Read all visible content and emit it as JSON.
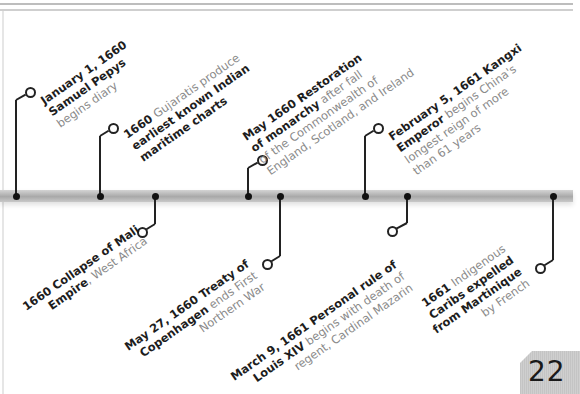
{
  "timeline": {
    "above": [
      {
        "date": "January 1, 1660",
        "lines": [
          [
            {
              "t": "January 1, 1660",
              "b": true
            }
          ],
          [
            {
              "t": "Samuel Pepys",
              "b": true
            }
          ],
          [
            {
              "t": "begins diary",
              "b": false
            }
          ]
        ]
      },
      {
        "date": "1660",
        "lines": [
          [
            {
              "t": "1660 ",
              "b": true
            },
            {
              "t": "Gujaratis produce",
              "b": false
            }
          ],
          [
            {
              "t": "earliest known Indian",
              "b": true
            }
          ],
          [
            {
              "t": "maritime charts",
              "b": true
            }
          ]
        ]
      },
      {
        "date": "May 1660",
        "lines": [
          [
            {
              "t": "May 1660 Restoration",
              "b": true
            }
          ],
          [
            {
              "t": "of monarchy",
              "b": true
            },
            {
              "t": " after fall",
              "b": false
            }
          ],
          [
            {
              "t": "of the Commonwealth of",
              "b": false
            }
          ],
          [
            {
              "t": "England, Scotland, and Ireland",
              "b": false
            }
          ]
        ]
      },
      {
        "date": "February 5, 1661",
        "lines": [
          [
            {
              "t": "February 5, 1661 Kangxi",
              "b": true
            }
          ],
          [
            {
              "t": "Emperor",
              "b": true
            },
            {
              "t": " begins China's",
              "b": false
            }
          ],
          [
            {
              "t": "longest reign of more",
              "b": false
            }
          ],
          [
            {
              "t": "than 61 years",
              "b": false
            }
          ]
        ]
      }
    ],
    "below": [
      {
        "date": "1660",
        "lines": [
          [
            {
              "t": "1660 Collapse of Mali",
              "b": true
            }
          ],
          [
            {
              "t": "Empire",
              "b": true
            },
            {
              "t": ", West Africa",
              "b": false
            }
          ]
        ]
      },
      {
        "date": "May 27, 1660",
        "lines": [
          [
            {
              "t": "May 27, 1660 Treaty of",
              "b": true
            }
          ],
          [
            {
              "t": "Copenhagen",
              "b": true
            },
            {
              "t": " ends First",
              "b": false
            }
          ],
          [
            {
              "t": "Northern War",
              "b": false
            }
          ]
        ]
      },
      {
        "date": "March 9, 1661",
        "lines": [
          [
            {
              "t": "March 9, 1661 Personal rule of",
              "b": true
            }
          ],
          [
            {
              "t": "Louis XIV",
              "b": true
            },
            {
              "t": " begins with death of",
              "b": false
            }
          ],
          [
            {
              "t": "regent, Cardinal Mazarin",
              "b": false
            }
          ]
        ]
      },
      {
        "date": "1661",
        "lines": [
          [
            {
              "t": "1661 ",
              "b": true
            },
            {
              "t": "Indigenous",
              "b": false
            }
          ],
          [
            {
              "t": "Caribs expelled",
              "b": true
            }
          ],
          [
            {
              "t": "from Martinique",
              "b": true
            }
          ],
          [
            {
              "t": "by French",
              "b": false
            }
          ]
        ]
      }
    ]
  },
  "page": {
    "number": "22"
  },
  "colors": {
    "bar": "#b0b0b0",
    "ink": "#1d1d1d",
    "muted": "#8a8a8a",
    "tab": "#c8c8c8"
  }
}
